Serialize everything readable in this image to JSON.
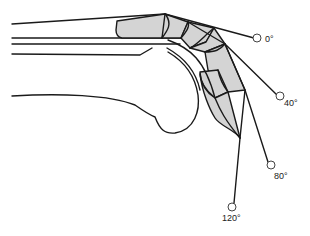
{
  "diagram": {
    "colors": {
      "stroke": "#1a1a1a",
      "fill": "#d4d4d4",
      "background": "#ffffff"
    },
    "angles": [
      {
        "label": "0°",
        "x": 258,
        "y": 38
      },
      {
        "label": "40°",
        "x": 281,
        "y": 96
      },
      {
        "label": "80°",
        "x": 272,
        "y": 165
      },
      {
        "label": "120°",
        "x": 233,
        "y": 207
      }
    ]
  }
}
